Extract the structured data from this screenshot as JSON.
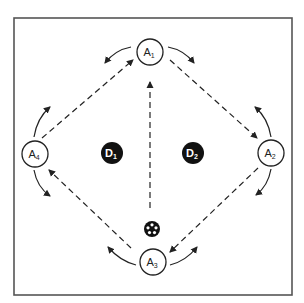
{
  "diagram": {
    "frame": {
      "x": 14,
      "y": 18,
      "width": 278,
      "height": 277,
      "stroke": "#555555"
    },
    "colors": {
      "line": "#222222",
      "defender_fill": "#111111",
      "attacker_fill": "#ffffff"
    },
    "attackers": [
      {
        "id": "A1",
        "letter": "A",
        "sub": "1",
        "cx": 150,
        "cy": 52
      },
      {
        "id": "A2",
        "letter": "A",
        "sub": "2",
        "cx": 271,
        "cy": 153
      },
      {
        "id": "A3",
        "letter": "A",
        "sub": "3",
        "cx": 153,
        "cy": 262
      },
      {
        "id": "A4",
        "letter": "A",
        "sub": "4",
        "cx": 35,
        "cy": 154
      }
    ],
    "defenders": [
      {
        "id": "D1",
        "letter": "D",
        "sub": "1",
        "cx": 112,
        "cy": 153
      },
      {
        "id": "D2",
        "letter": "D",
        "sub": "2",
        "cx": 193,
        "cy": 153
      }
    ],
    "ball": {
      "cx": 152,
      "cy": 229,
      "r": 8
    },
    "passes": [
      {
        "from": "A4",
        "to": "A1",
        "x1": 42,
        "y1": 138,
        "x2": 133,
        "y2": 60
      },
      {
        "from": "A1",
        "to": "A2",
        "x1": 170,
        "y1": 60,
        "x2": 257,
        "y2": 138
      },
      {
        "from": "A2",
        "to": "A3",
        "x1": 258,
        "y1": 168,
        "x2": 170,
        "y2": 252
      },
      {
        "from": "A3",
        "to": "A4",
        "x1": 131,
        "y1": 248,
        "x2": 49,
        "y2": 170
      },
      {
        "from": "A3",
        "to": "A1",
        "x1": 150,
        "y1": 208,
        "x2": 150,
        "y2": 82
      }
    ],
    "movements": [
      {
        "player": "A1",
        "d": "M131,47 Q115,50 105,63"
      },
      {
        "player": "A1",
        "d": "M168,47 Q184,50 194,63"
      },
      {
        "player": "A2",
        "d": "M271,137 Q268,118 255,107"
      },
      {
        "player": "A2",
        "d": "M271,169 Q268,186 256,195"
      },
      {
        "player": "A3",
        "d": "M136,265 Q120,261 108,247"
      },
      {
        "player": "A3",
        "d": "M170,265 Q186,261 197,247"
      },
      {
        "player": "A4",
        "d": "M34,137 Q37,118 50,107"
      },
      {
        "player": "A4",
        "d": "M34,170 Q37,187 50,196"
      }
    ]
  }
}
